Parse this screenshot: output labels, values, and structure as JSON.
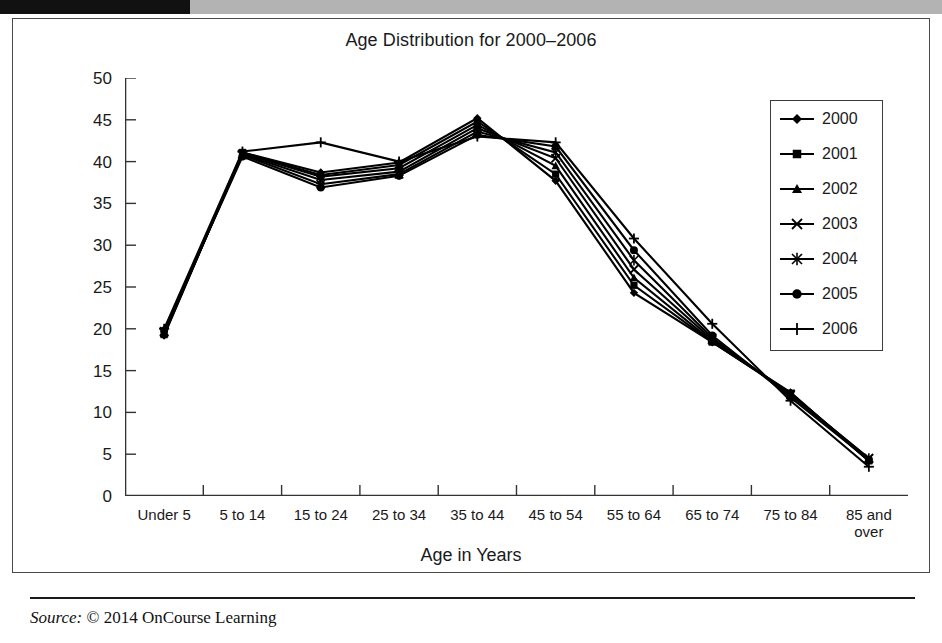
{
  "figure": {
    "title": "Age Distribution for 2000–2006",
    "source_label": "Source:",
    "source_text": "© 2014 OnCourse Learning"
  },
  "chart_data": {
    "type": "line",
    "title": "Age Distribution for 2000–2006",
    "xlabel": "Age in Years",
    "ylabel": "In Millions",
    "ylim": [
      0,
      50
    ],
    "yticks": [
      0,
      5,
      10,
      15,
      20,
      25,
      30,
      35,
      40,
      45,
      50
    ],
    "grid": false,
    "legend_position": "right",
    "categories": [
      "Under 5",
      "5 to 14",
      "15 to 24",
      "25 to 34",
      "35 to 44",
      "45 to 54",
      "55 to 64",
      "65 to 74",
      "75 to 84",
      "85 and\nover"
    ],
    "series": [
      {
        "name": "2000",
        "marker": "diamond",
        "values": [
          19.2,
          41.1,
          38.7,
          39.9,
          45.2,
          37.7,
          24.3,
          18.4,
          12.4,
          4.2
        ]
      },
      {
        "name": "2001",
        "marker": "square",
        "values": [
          19.3,
          41.1,
          38.4,
          39.6,
          44.8,
          38.5,
          25.2,
          18.4,
          12.3,
          4.2
        ]
      },
      {
        "name": "2002",
        "marker": "triangle",
        "values": [
          19.4,
          41.0,
          38.2,
          39.2,
          44.4,
          39.5,
          26.1,
          18.5,
          12.3,
          4.3
        ]
      },
      {
        "name": "2003",
        "marker": "x",
        "values": [
          19.6,
          40.9,
          37.8,
          38.8,
          44.0,
          40.4,
          27.1,
          18.7,
          12.2,
          4.5
        ]
      },
      {
        "name": "2004",
        "marker": "asterisk",
        "values": [
          19.7,
          40.8,
          37.3,
          38.5,
          43.6,
          41.1,
          28.2,
          18.9,
          12.1,
          4.5
        ]
      },
      {
        "name": "2005",
        "marker": "circle",
        "values": [
          19.8,
          40.6,
          36.9,
          38.3,
          43.2,
          41.8,
          29.4,
          19.2,
          11.8,
          4.3
        ]
      },
      {
        "name": "2006",
        "marker": "plus",
        "values": [
          20.0,
          41.2,
          42.3,
          40.0,
          43.0,
          42.3,
          30.8,
          20.6,
          11.4,
          3.5
        ]
      }
    ]
  }
}
